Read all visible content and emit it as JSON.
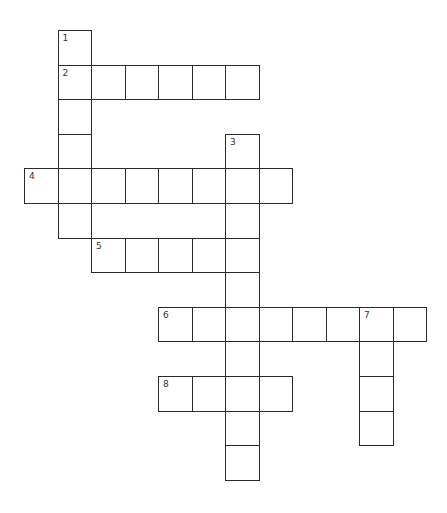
{
  "puzzle": {
    "type": "crossword",
    "colors": {
      "line": "#2a2a2a",
      "number": "#333333",
      "background": "#ffffff"
    },
    "grid": {
      "origin_x": 24,
      "origin_y": 30,
      "cell_w": 33.5,
      "cell_h": 34.6
    },
    "words": [
      {
        "number": "1",
        "direction": "down",
        "row": 0,
        "col": 1,
        "length": 6
      },
      {
        "number": "2",
        "direction": "across",
        "row": 1,
        "col": 1,
        "length": 6
      },
      {
        "number": "3",
        "direction": "down",
        "row": 3,
        "col": 6,
        "length": 10
      },
      {
        "number": "4",
        "direction": "across",
        "row": 4,
        "col": 0,
        "length": 8
      },
      {
        "number": "5",
        "direction": "across",
        "row": 6,
        "col": 2,
        "length": 5
      },
      {
        "number": "6",
        "direction": "across",
        "row": 8,
        "col": 4,
        "length": 8
      },
      {
        "number": "7",
        "direction": "down",
        "row": 8,
        "col": 10,
        "length": 4
      },
      {
        "number": "8",
        "direction": "across",
        "row": 10,
        "col": 4,
        "length": 4
      }
    ]
  }
}
